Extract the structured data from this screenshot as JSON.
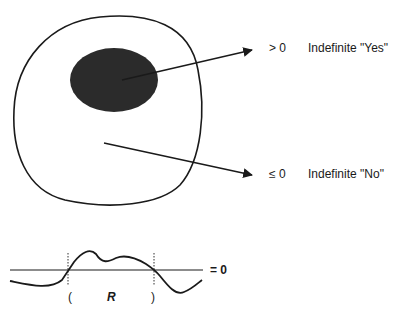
{
  "diagram": {
    "regions": {
      "outer": "Set (outer region)",
      "inner": "Shaded inner region"
    },
    "labels": {
      "yes_sign": "> 0",
      "yes_text": "Indefinite \"Yes\"",
      "no_sign": "≤ 0",
      "no_text": "Indefinite \"No\"",
      "zero_line": "= 0",
      "paren_open": "(",
      "region_r": "R",
      "paren_close": ")"
    },
    "colors": {
      "ink": "#1a1a1a",
      "fill": "#2b2b2b",
      "background": "#ffffff"
    }
  }
}
